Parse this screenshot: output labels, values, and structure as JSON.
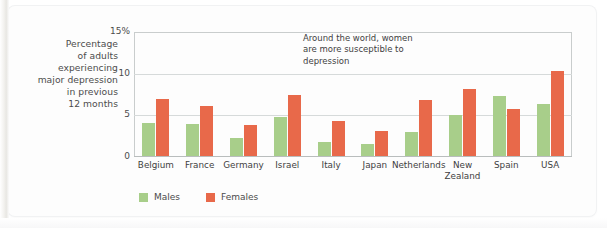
{
  "chart_data": {
    "type": "bar",
    "title": "",
    "subtitle": "",
    "xlabel": "",
    "ylabel": "Percentage of adults experiencing major depression in previous 12 months",
    "ylim": [
      0,
      15
    ],
    "yticks": [
      "0",
      "5",
      "10",
      "15%"
    ],
    "grid": true,
    "legend_position": "bottom-left",
    "categories": [
      "Belgium",
      "France",
      "Germany",
      "Israel",
      "Italy",
      "Japan",
      "Netherlands",
      "New Zealand",
      "Spain",
      "USA"
    ],
    "series": [
      {
        "name": "Males",
        "color": "#a8ce8a",
        "values": [
          4.0,
          3.9,
          2.2,
          4.7,
          1.7,
          1.5,
          2.9,
          4.9,
          7.2,
          6.3
        ]
      },
      {
        "name": "Females",
        "color": "#e8694a",
        "values": [
          6.9,
          6.0,
          3.7,
          7.3,
          4.2,
          3.0,
          6.7,
          8.0,
          5.7,
          10.2
        ]
      }
    ],
    "annotations": [
      "Around the world, women are more susceptible to depression"
    ]
  },
  "y_caption": {
    "line1": "Percentage",
    "line2": "of adults",
    "line3": "experiencing",
    "line4": "major depression",
    "line5": "in previous",
    "line6": "12 months"
  },
  "yticks": {
    "t15": "15%",
    "t10": "10",
    "t5": "5",
    "t0": "0"
  },
  "annotation": {
    "line1": "Around the world, women",
    "line2": "are more susceptible to",
    "line3": "depression"
  },
  "xlabels": {
    "belgium": {
      "line1": "Belgium",
      "line2": ""
    },
    "france": {
      "line1": "France",
      "line2": ""
    },
    "germany": {
      "line1": "Germany",
      "line2": ""
    },
    "israel": {
      "line1": "Israel",
      "line2": ""
    },
    "italy": {
      "line1": "Italy",
      "line2": ""
    },
    "japan": {
      "line1": "Japan",
      "line2": ""
    },
    "netherlands": {
      "line1": "Netherlands",
      "line2": ""
    },
    "newzealand": {
      "line1": "New",
      "line2": "Zealand"
    },
    "spain": {
      "line1": "Spain",
      "line2": ""
    },
    "usa": {
      "line1": "USA",
      "line2": ""
    }
  },
  "legend": {
    "males": "Males",
    "females": "Females"
  },
  "colors": {
    "male_bar": "#a8ce8a",
    "female_bar": "#e8694a",
    "gridline": "#d6dada",
    "axis": "#c9cdcd",
    "text": "#4c4c4c",
    "background": "#fdfdfd"
  }
}
